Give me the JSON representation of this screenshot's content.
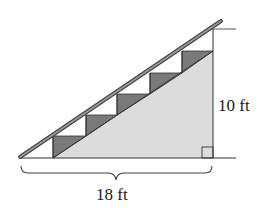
{
  "diagram": {
    "labels": {
      "height": "10 ft",
      "base": "18 ft"
    },
    "steps": 5,
    "colors": {
      "background": "#ffffff",
      "line": "#3a3a3a",
      "fill_light": "#dcdcdc",
      "fill_step": "#7a7a7a",
      "railing": "#6e6e6e"
    }
  }
}
